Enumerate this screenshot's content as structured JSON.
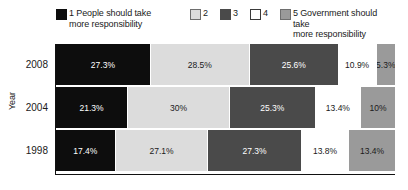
{
  "legend": {
    "items": [
      {
        "key": "1",
        "label": "1 People should take\nmore responsibility",
        "color": "#0d0d0d",
        "border": "#0d0d0d"
      },
      {
        "key": "2",
        "label": "2",
        "color": "#dcdcdc",
        "border": "#6e6e6e"
      },
      {
        "key": "3",
        "label": "3",
        "color": "#4a4a4a",
        "border": "#4a4a4a"
      },
      {
        "key": "4",
        "label": "4",
        "color": "#ffffff",
        "border": "#3a3a3a"
      },
      {
        "key": "5",
        "label": "5 Government should take\nmore responsibility",
        "color": "#9a9a9a",
        "border": "#6e6e6e"
      }
    ]
  },
  "axes": {
    "y_title": "Year"
  },
  "chart_data": {
    "type": "bar",
    "orientation": "horizontal",
    "stacked": true,
    "stack_mode": "percent",
    "title": "",
    "xlabel": "",
    "ylabel": "Year",
    "xlim": [
      0,
      100
    ],
    "grid": false,
    "legend_position": "top",
    "categories": [
      "2008",
      "2004",
      "1998"
    ],
    "series": [
      {
        "name": "1 People should take more responsibility",
        "color": "#0d0d0d",
        "text_color": "#ffffff",
        "values": [
          27.3,
          21.3,
          17.4
        ],
        "labels": [
          "27.3%",
          "21.3%",
          "17.4%"
        ]
      },
      {
        "name": "2",
        "color": "#dcdcdc",
        "text_color": "#1a1a1a",
        "values": [
          28.5,
          30.0,
          27.1
        ],
        "labels": [
          "28.5%",
          "30%",
          "27.1%"
        ]
      },
      {
        "name": "3",
        "color": "#4a4a4a",
        "text_color": "#ffffff",
        "values": [
          25.6,
          25.3,
          27.3
        ],
        "labels": [
          "25.6%",
          "25.3%",
          "27.3%"
        ]
      },
      {
        "name": "4",
        "color": "#ffffff",
        "text_color": "#1a1a1a",
        "values": [
          10.9,
          13.4,
          13.8
        ],
        "labels": [
          "10.9%",
          "13.4%",
          "13.8%"
        ]
      },
      {
        "name": "5 Government should take more responsibility",
        "color": "#9a9a9a",
        "text_color": "#1a1a1a",
        "values": [
          5.3,
          10.0,
          13.4
        ],
        "labels": [
          "5.3%",
          "10%",
          "13.4%"
        ]
      }
    ],
    "rows": [
      {
        "category": "2008",
        "segments": [
          {
            "series": "1",
            "value": 27.3,
            "label": "27.3%",
            "color": "#0d0d0d",
            "text_color": "#ffffff"
          },
          {
            "series": "2",
            "value": 28.5,
            "label": "28.5%",
            "color": "#dcdcdc",
            "text_color": "#1a1a1a"
          },
          {
            "series": "3",
            "value": 25.6,
            "label": "25.6%",
            "color": "#4a4a4a",
            "text_color": "#ffffff"
          },
          {
            "series": "4",
            "value": 10.9,
            "label": "10.9%",
            "color": "#ffffff",
            "text_color": "#1a1a1a"
          },
          {
            "series": "5",
            "value": 5.3,
            "label": "5.3%",
            "color": "#9a9a9a",
            "text_color": "#1a1a1a"
          }
        ]
      },
      {
        "category": "2004",
        "segments": [
          {
            "series": "1",
            "value": 21.3,
            "label": "21.3%",
            "color": "#0d0d0d",
            "text_color": "#ffffff"
          },
          {
            "series": "2",
            "value": 30.0,
            "label": "30%",
            "color": "#dcdcdc",
            "text_color": "#1a1a1a"
          },
          {
            "series": "3",
            "value": 25.3,
            "label": "25.3%",
            "color": "#4a4a4a",
            "text_color": "#ffffff"
          },
          {
            "series": "4",
            "value": 13.4,
            "label": "13.4%",
            "color": "#ffffff",
            "text_color": "#1a1a1a"
          },
          {
            "series": "5",
            "value": 10.0,
            "label": "10%",
            "color": "#9a9a9a",
            "text_color": "#1a1a1a"
          }
        ]
      },
      {
        "category": "1998",
        "segments": [
          {
            "series": "1",
            "value": 17.4,
            "label": "17.4%",
            "color": "#0d0d0d",
            "text_color": "#ffffff"
          },
          {
            "series": "2",
            "value": 27.1,
            "label": "27.1%",
            "color": "#dcdcdc",
            "text_color": "#1a1a1a"
          },
          {
            "series": "3",
            "value": 27.3,
            "label": "27.3%",
            "color": "#4a4a4a",
            "text_color": "#ffffff"
          },
          {
            "series": "4",
            "value": 13.8,
            "label": "13.8%",
            "color": "#ffffff",
            "text_color": "#1a1a1a"
          },
          {
            "series": "5",
            "value": 13.4,
            "label": "13.4%",
            "color": "#9a9a9a",
            "text_color": "#1a1a1a"
          }
        ]
      }
    ]
  }
}
